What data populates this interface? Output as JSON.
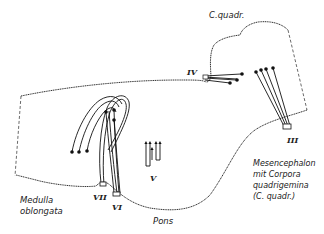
{
  "labels": {
    "c_quadr": "C.quadr.",
    "medulla_1": "Medulla",
    "medulla_2": "oblongata",
    "pons": "Pons",
    "mes_1": "Mesencephalon",
    "mes_2": "mit Corpora",
    "mes_3": "quadrigemina",
    "mes_4": "(C. quadr.)"
  },
  "nerves": {
    "III": "III",
    "IV": "IV",
    "V": "V",
    "VI": "VI",
    "VII": "VII"
  },
  "colors": {
    "ink": "#111111",
    "background": "#ffffff"
  }
}
